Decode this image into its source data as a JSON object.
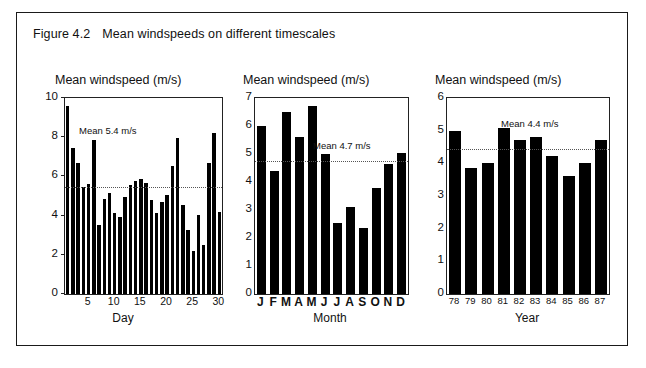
{
  "figure": {
    "number": "Figure 4.2",
    "title": "Mean windspeeds on different timescales"
  },
  "chart_data": [
    {
      "type": "bar",
      "id": "daily",
      "title": "Mean windspeed (m/s)",
      "xlabel": "Day",
      "ylabel": "Mean windspeed (m/s)",
      "ylim": [
        0,
        10
      ],
      "yticks": [
        0,
        2,
        4,
        6,
        8,
        10
      ],
      "xticks": [
        5,
        10,
        15,
        20,
        25,
        30
      ],
      "grid": false,
      "categories": [
        1,
        2,
        3,
        4,
        5,
        6,
        7,
        8,
        9,
        10,
        11,
        12,
        13,
        14,
        15,
        16,
        17,
        18,
        19,
        20,
        21,
        22,
        23,
        24,
        25,
        26,
        27,
        28,
        29,
        30
      ],
      "values": [
        9.6,
        7.45,
        6.7,
        5.45,
        5.6,
        7.85,
        3.5,
        4.85,
        5.15,
        4.15,
        3.95,
        4.95,
        5.55,
        5.75,
        5.85,
        5.65,
        4.8,
        4.15,
        4.7,
        5.05,
        6.55,
        7.95,
        4.55,
        3.25,
        2.2,
        4.05,
        2.5,
        6.7,
        8.2,
        4.2
      ],
      "mean": 5.4,
      "mean_label": "Mean 5.4 m/s"
    },
    {
      "type": "bar",
      "id": "monthly",
      "title": "Mean windspeed (m/s)",
      "xlabel": "Month",
      "ylabel": "Mean windspeed (m/s)",
      "ylim": [
        0,
        7
      ],
      "yticks": [
        0,
        1,
        2,
        3,
        4,
        5,
        6,
        7
      ],
      "categories": [
        "J",
        "F",
        "M",
        "A",
        "M",
        "J",
        "J",
        "A",
        "S",
        "O",
        "N",
        "D"
      ],
      "values": [
        6.0,
        4.4,
        6.5,
        5.6,
        6.7,
        5.0,
        2.55,
        3.1,
        2.35,
        3.8,
        4.65,
        5.05
      ],
      "grid": false,
      "mean": 4.7,
      "mean_label": "Mean 4.7 m/s"
    },
    {
      "type": "bar",
      "id": "yearly",
      "title": "Mean windspeed (m/s)",
      "xlabel": "Year",
      "ylabel": "Mean windspeed (m/s)",
      "ylim": [
        0,
        6
      ],
      "yticks": [
        0,
        1,
        2,
        3,
        4,
        5,
        6
      ],
      "categories": [
        "78",
        "79",
        "80",
        "81",
        "82",
        "83",
        "84",
        "85",
        "86",
        "87"
      ],
      "values": [
        5.0,
        3.85,
        4.02,
        5.07,
        4.7,
        4.8,
        4.22,
        3.6,
        4.0,
        4.7
      ],
      "grid": false,
      "mean": 4.4,
      "mean_label": "Mean 4.4 m/s"
    }
  ]
}
